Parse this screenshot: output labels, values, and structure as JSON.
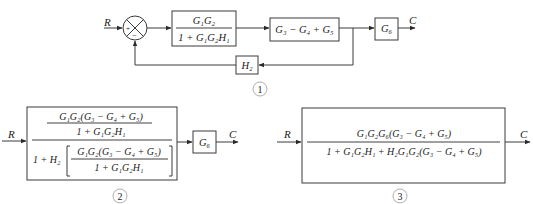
{
  "diagram_1": {
    "label": "1",
    "input": "R",
    "output": "C",
    "summing_junction": {
      "signs": [
        "+",
        "−"
      ]
    },
    "blocks": [
      {
        "id": "block-g1g2-closed",
        "numerator": "G₁G₂",
        "denominator": "1 + G₁G₂H₁"
      },
      {
        "id": "block-g3-g4-g5",
        "text": "G₃ − G₄ + G₅"
      },
      {
        "id": "block-g6",
        "text": "G₆"
      },
      {
        "id": "block-h2",
        "text": "H₂"
      }
    ]
  },
  "diagram_2": {
    "label": "2",
    "input": "R",
    "output": "C",
    "big_block": {
      "outer_numerator": {
        "numerator": "G₁G₂(G₃ − G₄ + G₅)",
        "denominator": "1 + G₁G₂H₁"
      },
      "outer_denominator": {
        "prefix": "1 + H₂",
        "numerator": "G₁G₂(G₃ − G₄ + G₅)",
        "denominator": "1 + G₁G₂H₁"
      }
    },
    "g6_block": "G₆"
  },
  "diagram_3": {
    "label": "3",
    "input": "R",
    "output": "C",
    "block": {
      "numerator": "G₁G₂G₆(G₃ − G₄ + G₅)",
      "denominator": "1 + G₁G₂H₁ + H₂G₁G₂(G₃ − G₄ + G₅)"
    }
  },
  "colors": {
    "stroke": "#3a3a3a",
    "text": "#1a1a1a",
    "label_circle": "#9a9a9a",
    "background": "#ffffff"
  }
}
